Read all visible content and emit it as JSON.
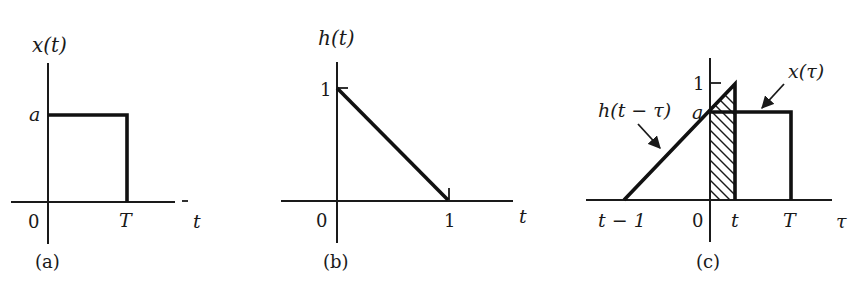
{
  "figure": {
    "panels": [
      {
        "id": "a",
        "caption": "(a)",
        "ylabel": "x(t)",
        "xlabel": "t",
        "origin_label": "0",
        "level_label": "a",
        "end_label": "T",
        "signal": "rectangular pulse of height a from 0 to T"
      },
      {
        "id": "b",
        "caption": "(b)",
        "ylabel": "h(t)",
        "xlabel": "t",
        "origin_label": "0",
        "y_tick_label": "1",
        "x_tick_label": "1",
        "signal": "decreasing ramp from 1 at t=0 to 0 at t=1"
      },
      {
        "id": "c",
        "caption": "(c)",
        "xlabel": "τ",
        "origin_label": "0",
        "y_tick_label": "1",
        "level_label": "a",
        "ramp_start_label": "t − 1",
        "t_label": "t",
        "end_label": "T",
        "annotation_h": "h(t − τ)",
        "annotation_x": "x(τ)",
        "shaded_region": "overlap of h(t−τ) and x(τ) for 0 ≤ τ ≤ t"
      }
    ]
  },
  "colors": {
    "ink": "#111111",
    "background": "#ffffff"
  }
}
